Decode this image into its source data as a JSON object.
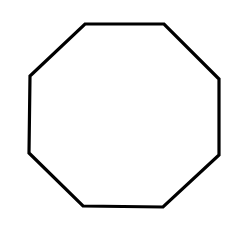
{
  "canvas": {
    "width": 243,
    "height": 237,
    "background": "#ffffff"
  },
  "shape": {
    "type": "octagon",
    "stroke": "#000000",
    "stroke_width": 3.2,
    "fill": "none",
    "points": "85,24 164,24 219,79 219,155 163,207 83,206 29,153 30,76"
  }
}
